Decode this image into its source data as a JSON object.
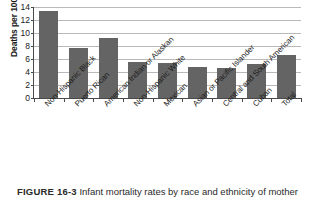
{
  "figure": {
    "caption_label": "FIGURE 16-3",
    "caption_text": "Infant mortality rates by race and ethnicity of mother"
  },
  "chart_data": {
    "type": "bar",
    "title": "",
    "xlabel": "",
    "ylabel": "Deaths per 1000 live births",
    "ylim": [
      0,
      14
    ],
    "ytick_step": 2,
    "grid": true,
    "legend": "none",
    "bar_color": "#646464",
    "categories": [
      "Non-Hispanic Black",
      "Puerto Rican",
      "American Indian or Alaskan",
      "Non-Hispanic White",
      "Mexican",
      "Asian or Pacific Islander",
      "Central and South American",
      "Cuban",
      "Total"
    ],
    "values": [
      13.3,
      7.6,
      9.1,
      5.5,
      5.3,
      4.7,
      4.5,
      5.1,
      6.6
    ],
    "yticks": [
      0,
      2,
      4,
      6,
      8,
      10,
      12,
      14
    ],
    "ytick_labels": [
      "0",
      "2",
      "4",
      "6",
      "8",
      "10",
      "12",
      "14"
    ]
  }
}
